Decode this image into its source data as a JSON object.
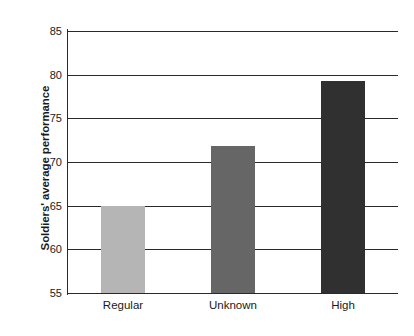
{
  "chart_data": {
    "type": "bar",
    "title": "",
    "subtitle": "",
    "xlabel": "",
    "ylabel": "Soldiers' average performance",
    "categories": [
      "Regular",
      "Unknown",
      "High"
    ],
    "values": [
      65.0,
      71.8,
      79.3
    ],
    "series": [
      {
        "name": "Soldiers' average performance",
        "values": [
          65.0,
          71.8,
          79.3
        ]
      }
    ],
    "bar_colors": [
      "#b5b5b5",
      "#666666",
      "#303030"
    ],
    "ylim": [
      55,
      85
    ],
    "yticks": [
      55,
      60,
      65,
      70,
      75,
      80,
      85
    ],
    "ytick_labels": [
      "55",
      "60",
      "65",
      "70",
      "75",
      "80",
      "85"
    ],
    "xtick_labels": [
      "Regular",
      "Unknown",
      "High"
    ],
    "grid": true,
    "grid_axis": "y",
    "grid_color": "#2a2a2a",
    "legend": false,
    "legend_position": "none",
    "annotations": [],
    "axis_color": "#2a2a2a",
    "background_color": "#ffffff"
  }
}
